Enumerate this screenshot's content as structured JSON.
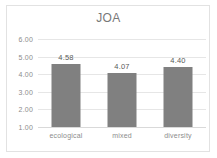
{
  "chart_data": {
    "type": "bar",
    "title": "JOA",
    "xlabel": "",
    "ylabel": "",
    "categories": [
      "ecological",
      "mixed",
      "diversity"
    ],
    "values": [
      4.58,
      4.07,
      4.4
    ],
    "value_labels": [
      "4.58",
      "4.07",
      "4.40"
    ],
    "ylim": [
      1.0,
      6.0
    ],
    "ytick_step": 1.0,
    "ytick_labels": [
      "6.00",
      "5.00",
      "4.00",
      "3.00",
      "2.00",
      "1.00"
    ],
    "ytick_values": [
      6.0,
      5.0,
      4.0,
      3.0,
      2.0,
      1.0
    ],
    "grid": true,
    "legend": false,
    "legend_position": "none",
    "bar_color": "#808080",
    "gridline_color": "#e6e6e6",
    "title_color": "#787878",
    "tick_color": "#8c8c8c",
    "label_color": "#595959",
    "plot_background": "#ffffff",
    "border_color": "#e2e2e2"
  }
}
